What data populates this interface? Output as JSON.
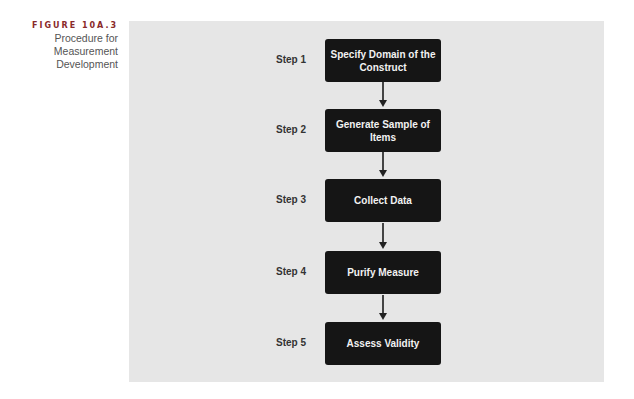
{
  "caption": {
    "figure_label": "FIGURE 10A.3",
    "title_lines": [
      "Procedure for",
      "Measurement",
      "Development"
    ]
  },
  "steps": [
    {
      "label": "Step 1",
      "text": "Specify Domain of the Construct"
    },
    {
      "label": "Step 2",
      "text": "Generate Sample of Items"
    },
    {
      "label": "Step 3",
      "text": "Collect Data"
    },
    {
      "label": "Step 4",
      "text": "Purify Measure"
    },
    {
      "label": "Step 5",
      "text": "Assess Validity"
    }
  ],
  "colors": {
    "panel": "#e6e6e6",
    "box": "#151515",
    "figure_label": "#8a2a2a"
  }
}
